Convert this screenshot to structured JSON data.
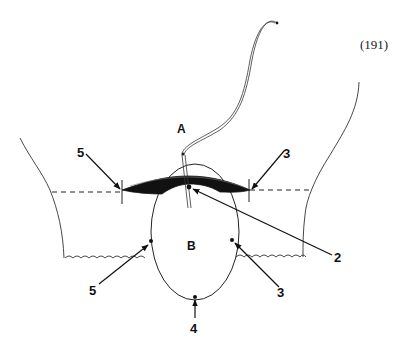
{
  "figure": {
    "number": "(191)",
    "region_labels": {
      "upper": "A",
      "lower": "B"
    },
    "callouts": [
      {
        "id": "upper-left",
        "label": "5"
      },
      {
        "id": "upper-right",
        "label": "3"
      },
      {
        "id": "center-top",
        "label": "2"
      },
      {
        "id": "lower-left",
        "label": "5"
      },
      {
        "id": "lower-right",
        "label": "3"
      },
      {
        "id": "bottom",
        "label": "4"
      }
    ]
  }
}
